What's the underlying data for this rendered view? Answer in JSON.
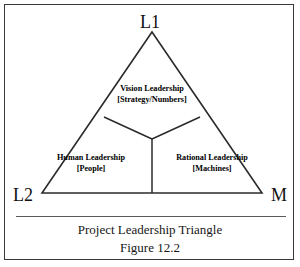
{
  "figure": {
    "vertices": {
      "top": "L1",
      "bottom_left": "L2",
      "bottom_right": "M"
    },
    "zones": [
      {
        "id": "vision",
        "title": "Vision Leadership",
        "subtitle": "[Strategy/Numbers]"
      },
      {
        "id": "human",
        "title": "Human Leadership",
        "subtitle": "[People]"
      },
      {
        "id": "rational",
        "title": "Rational Leadership",
        "subtitle": "[Machines]"
      }
    ],
    "caption": {
      "title": "Project Leadership Triangle",
      "number": "Figure 12.2"
    },
    "colors": {
      "ink": "#000000",
      "line": "#2b2b2b",
      "border": "#3a3a3a",
      "rule": "#5a5a5a",
      "background": "#ffffff"
    }
  }
}
